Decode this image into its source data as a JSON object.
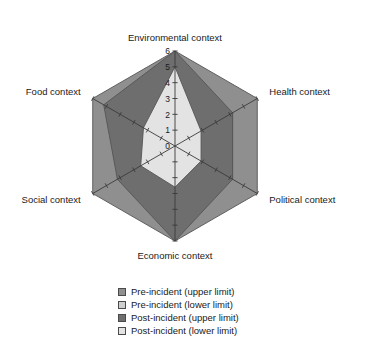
{
  "chart_data": {
    "type": "radar",
    "title": "",
    "categories": [
      "Environmental context",
      "Health context",
      "Political context",
      "Economic context",
      "Social context",
      "Food context"
    ],
    "ylim": [
      0,
      6
    ],
    "tick_labels": [
      "6",
      "5",
      "4",
      "3",
      "2",
      "1",
      "0"
    ],
    "tick_values": [
      6,
      5,
      4,
      3,
      2,
      1,
      0
    ],
    "grid": false,
    "legend_position": "bottom",
    "series": [
      {
        "name": "Pre-incident (upper limit)",
        "color": "#8f8f8f",
        "values": [
          6,
          6,
          6,
          6,
          6,
          6
        ]
      },
      {
        "name": "Pre-incident (lower limit)",
        "color": "#cfcfcf",
        "values": [
          5,
          4.2,
          4.2,
          4.2,
          4.2,
          4.2
        ]
      },
      {
        "name": "Post-incident (upper limit)",
        "color": "#6e6e6e",
        "values": [
          6,
          4.2,
          4.2,
          6,
          4.2,
          5.2
        ]
      },
      {
        "name": "Post-incident (lower limit)",
        "color": "#e3e3e3",
        "values": [
          5,
          1.9,
          1.9,
          2.6,
          2.5,
          2.3
        ]
      }
    ]
  },
  "axis_labels": {
    "environmental": "Environmental context",
    "health": "Health context",
    "political": "Political context",
    "economic": "Economic context",
    "social": "Social context",
    "food": "Food context"
  },
  "legend": {
    "items": [
      {
        "label": "Pre-incident (upper limit)",
        "color": "#8f8f8f"
      },
      {
        "label": "Pre-incident (lower limit)",
        "color": "#cfcfcf"
      },
      {
        "label": "Post-incident (upper limit)",
        "color": "#6e6e6e"
      },
      {
        "label": "Post-incident (lower limit)",
        "color": "#e3e3e3"
      }
    ]
  }
}
